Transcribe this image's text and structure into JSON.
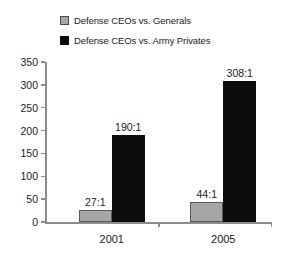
{
  "chart_data": {
    "type": "bar",
    "title": "",
    "xlabel": "",
    "ylabel": "",
    "categories": [
      "2001",
      "2005"
    ],
    "ylim": [
      0,
      350
    ],
    "yticks": [
      0,
      50,
      100,
      150,
      200,
      250,
      300,
      350
    ],
    "grid": false,
    "legend_position": "top",
    "series": [
      {
        "name": "Defense CEOs vs. Generals",
        "color": "#a6a6a6",
        "values": [
          27,
          44
        ],
        "labels": [
          "27:1",
          "44:1"
        ]
      },
      {
        "name": "Defense CEOs vs. Army Privates",
        "color": "#0d0d0d",
        "values": [
          190,
          308
        ],
        "labels": [
          "190:1",
          "308:1"
        ]
      }
    ]
  },
  "legend": {
    "items": [
      {
        "label": "Defense CEOs vs. Generals",
        "swatch": "gray-square-swatch"
      },
      {
        "label": "Defense CEOs vs. Army Privates",
        "swatch": "black-square-swatch"
      }
    ]
  },
  "yaxis": {
    "ticks": [
      {
        "label": "350",
        "value": 350
      },
      {
        "label": "300",
        "value": 300
      },
      {
        "label": "250",
        "value": 250
      },
      {
        "label": "200",
        "value": 200
      },
      {
        "label": "150",
        "value": 150
      },
      {
        "label": "100",
        "value": 100
      },
      {
        "label": "50",
        "value": 50
      },
      {
        "label": "0",
        "value": 0
      }
    ]
  },
  "xaxis": {
    "categories": [
      {
        "label": "2001"
      },
      {
        "label": "2005"
      }
    ]
  },
  "bars": [
    {
      "group": "2001",
      "series": "Defense CEOs vs. Generals",
      "value": 27,
      "label": "27:1"
    },
    {
      "group": "2001",
      "series": "Defense CEOs vs. Army Privates",
      "value": 190,
      "label": "190:1"
    },
    {
      "group": "2005",
      "series": "Defense CEOs vs. Generals",
      "value": 44,
      "label": "44:1"
    },
    {
      "group": "2005",
      "series": "Defense CEOs vs. Army Privates",
      "value": 308,
      "label": "308:1"
    }
  ]
}
